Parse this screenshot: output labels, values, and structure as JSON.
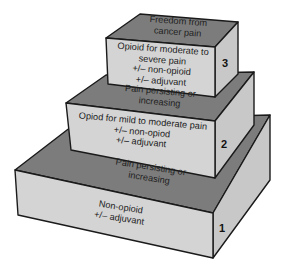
{
  "diagram": {
    "colors": {
      "front_face": "#d4d4d4",
      "top_face": "#7c7c7c",
      "side_face": "#c8c8c8",
      "edge": "#1a1a1a",
      "background": "#ffffff"
    },
    "steps": [
      {
        "number": "3",
        "top_label": [
          "Freedom from",
          "cancer pain"
        ],
        "front_label": [
          "Opioid for moderate to",
          "severe pain",
          "+/– non-opioid",
          "+/– adjuvant"
        ]
      },
      {
        "number": "2",
        "top_label": [
          "Pain persisting or",
          "increasing"
        ],
        "front_label": [
          "Opiod for mild to moderate pain",
          "+/– non-opiod",
          "+/– adjuvant"
        ]
      },
      {
        "number": "1",
        "top_label": [
          "Pain persisting or",
          "increasing"
        ],
        "front_label": [
          "Non-opioid",
          "+/– adjuvant"
        ]
      }
    ]
  }
}
